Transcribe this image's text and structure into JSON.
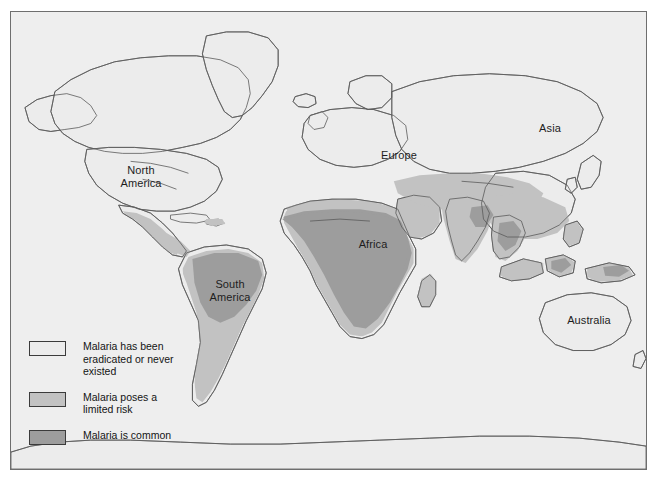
{
  "map": {
    "title": "World malaria distribution map",
    "background_color": "#eeeeee",
    "frame_color": "#6e6e6e",
    "coast_color": "#5a5a5a",
    "labels": [
      {
        "name": "north-america",
        "lines": [
          "North",
          "America"
        ]
      },
      {
        "name": "south-america",
        "lines": [
          "South",
          "America"
        ]
      },
      {
        "name": "africa",
        "lines": [
          "Africa"
        ]
      },
      {
        "name": "europe",
        "lines": [
          "Europe"
        ]
      },
      {
        "name": "asia",
        "lines": [
          "Asia"
        ]
      },
      {
        "name": "australia",
        "lines": [
          "Australia"
        ]
      }
    ],
    "label_text": {
      "north_america_line1": "North",
      "north_america_line2": "America",
      "south_america_line1": "South",
      "south_america_line2": "America",
      "africa": "Africa",
      "europe": "Europe",
      "asia": "Asia",
      "australia": "Australia"
    }
  },
  "legend": {
    "entries": [
      {
        "key": "eradicated",
        "color": "#ececec",
        "lines": [
          "Malaria has been",
          "eradicated or never",
          "existed"
        ]
      },
      {
        "key": "limited-risk",
        "color": "#c2c2c2",
        "lines": [
          "Malaria poses a",
          "limited risk"
        ]
      },
      {
        "key": "common",
        "color": "#9d9d9d",
        "lines": [
          "Malaria is common"
        ]
      }
    ],
    "entry1_line1": "Malaria has been",
    "entry1_line2": "eradicated or never",
    "entry1_line3": "existed",
    "entry2_line1": "Malaria poses a",
    "entry2_line2": "limited risk",
    "entry3_line1": "Malaria is common"
  },
  "colors": {
    "eradicated": "#ececec",
    "limited_risk": "#c2c2c2",
    "common": "#9d9d9d",
    "ocean": "#eeeeee",
    "outline": "#5a5a5a"
  }
}
